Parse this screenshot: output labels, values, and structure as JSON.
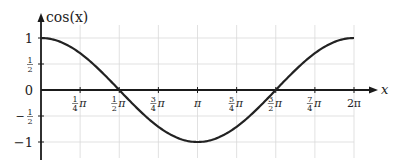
{
  "chart_data": {
    "type": "line",
    "title": "",
    "ylabel": "cos(x)",
    "xlabel": "x",
    "xlim": [
      0,
      6.2832
    ],
    "ylim": [
      -1,
      1
    ],
    "grid": true,
    "legend": null,
    "x_ticks": [
      {
        "value": 0.7854,
        "num": "1",
        "den": "4",
        "label": "1/4 π"
      },
      {
        "value": 1.5708,
        "num": "1",
        "den": "2",
        "label": "1/2 π"
      },
      {
        "value": 2.3562,
        "num": "3",
        "den": "4",
        "label": "3/4 π"
      },
      {
        "value": 3.1416,
        "num": "",
        "den": "",
        "label": "π"
      },
      {
        "value": 3.927,
        "num": "5",
        "den": "4",
        "label": "5/4 π"
      },
      {
        "value": 4.7124,
        "num": "3",
        "den": "2",
        "label": "3/2 π"
      },
      {
        "value": 5.4978,
        "num": "7",
        "den": "4",
        "label": "7/4 π"
      },
      {
        "value": 6.2832,
        "num": "",
        "den": "",
        "label": "2π"
      }
    ],
    "y_ticks": [
      {
        "value": 1,
        "label": "1"
      },
      {
        "value": 0.5,
        "label": "1/2"
      },
      {
        "value": 0,
        "label": "0"
      },
      {
        "value": -0.5,
        "label": "-1/2"
      },
      {
        "value": -1,
        "label": "-1"
      }
    ],
    "series": [
      {
        "name": "cos(x)",
        "function": "cos",
        "x_range": [
          0,
          6.2832
        ],
        "color": "#222222",
        "x": [
          0,
          0.7854,
          1.5708,
          2.3562,
          3.1416,
          3.927,
          4.7124,
          5.4978,
          6.2832
        ],
        "values": [
          1,
          0.7071,
          0,
          -0.7071,
          -1,
          -0.7071,
          0,
          0.7071,
          1
        ]
      }
    ],
    "colors": {
      "curve": "#222222",
      "axis": "#1a1a1a",
      "grid": "#d9d9d9"
    }
  }
}
